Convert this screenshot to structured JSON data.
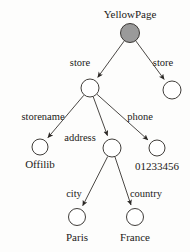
{
  "diagram": {
    "type": "tree",
    "background_color": "#fdfdfc",
    "stroke_color": "#2a2724",
    "filled_node_color": "#9a9a9a",
    "hollow_node_color": "#ffffff",
    "nodes": [
      {
        "id": "root",
        "label": "YellowPage",
        "label_pos": "above",
        "x": 130,
        "y": 33,
        "r": 9.5,
        "filled": true,
        "label_x": 130,
        "label_y": 9
      },
      {
        "id": "store1",
        "label": "",
        "label_pos": "none",
        "x": 90,
        "y": 88,
        "r": 9.0,
        "filled": false,
        "label_x": 0,
        "label_y": 0
      },
      {
        "id": "store2",
        "label": "",
        "label_pos": "none",
        "x": 172,
        "y": 90,
        "r": 9.0,
        "filled": false,
        "label_x": 0,
        "label_y": 0
      },
      {
        "id": "storename",
        "label": "Offilib",
        "label_pos": "below",
        "x": 40,
        "y": 147,
        "r": 8.0,
        "filled": false,
        "label_x": 40,
        "label_y": 159
      },
      {
        "id": "address",
        "label": "",
        "label_pos": "none",
        "x": 112,
        "y": 148,
        "r": 9.0,
        "filled": false,
        "label_x": 0,
        "label_y": 0
      },
      {
        "id": "phone",
        "label": "01233456",
        "label_pos": "below",
        "x": 157,
        "y": 148,
        "r": 8.0,
        "filled": false,
        "label_x": 157,
        "label_y": 161
      },
      {
        "id": "city",
        "label": "Paris",
        "label_pos": "below",
        "x": 77,
        "y": 217,
        "r": 8.5,
        "filled": false,
        "label_x": 77,
        "label_y": 232
      },
      {
        "id": "country",
        "label": "France",
        "label_pos": "below",
        "x": 135,
        "y": 217,
        "r": 8.5,
        "filled": false,
        "label_x": 135,
        "label_y": 232
      }
    ],
    "edges": [
      {
        "id": "e-root-store1",
        "from": "root",
        "to": "store1",
        "label": "store",
        "label_x": 80,
        "label_y": 58
      },
      {
        "id": "e-root-store2",
        "from": "root",
        "to": "store2",
        "label": "store",
        "label_x": 163,
        "label_y": 58
      },
      {
        "id": "e-store1-storename",
        "from": "store1",
        "to": "storename",
        "label": "storename",
        "label_x": 43,
        "label_y": 112
      },
      {
        "id": "e-store1-address",
        "from": "store1",
        "to": "address",
        "label": "address",
        "label_x": 80,
        "label_y": 133
      },
      {
        "id": "e-store1-phone",
        "from": "store1",
        "to": "phone",
        "label": "phone",
        "label_x": 140,
        "label_y": 112
      },
      {
        "id": "e-address-city",
        "from": "address",
        "to": "city",
        "label": "city",
        "label_x": 74,
        "label_y": 189
      },
      {
        "id": "e-address-country",
        "from": "address",
        "to": "country",
        "label": "country",
        "label_x": 146,
        "label_y": 189
      }
    ]
  }
}
